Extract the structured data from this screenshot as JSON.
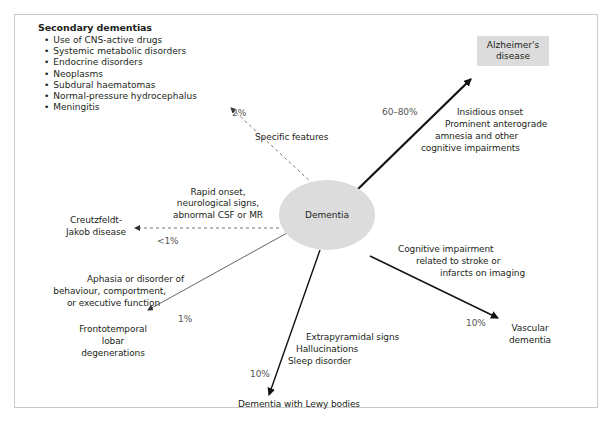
{
  "center": {
    "label": "Dementia"
  },
  "secondary": {
    "title": "Secondary dementias",
    "items": [
      "Use of CNS-active drugs",
      "Systemic metabolic disorders",
      "Endocrine disorders",
      "Neoplasms",
      "Subdural haematomas",
      "Normal-pressure hydrocephalus",
      "Meningitis"
    ],
    "percent": "2%",
    "feature": "Specific features"
  },
  "alzheimer": {
    "line1": "Alzheimer's",
    "line2": "disease",
    "percent": "60–80%",
    "features": [
      "Insidious onset",
      "Prominent anterograde",
      "amnesia and other",
      "cognitive impairments"
    ]
  },
  "cjd": {
    "line1": "Creutzfeldt-",
    "line2": "Jakob disease",
    "percent": "<1%",
    "features": [
      "Rapid onset,",
      "neurological signs,",
      "abnormal CSF or MR"
    ]
  },
  "ftld": {
    "lines": [
      "Frontotemporal",
      "lobar",
      "degenerations"
    ],
    "percent": "1%",
    "features": [
      "Aphasia or disorder of",
      "behaviour, comportment,",
      "or executive function"
    ]
  },
  "lewy": {
    "label": "Dementia with Lewy bodies",
    "percent": "10%",
    "features": [
      "Extrapyramidal signs",
      "Hallucinations",
      "Sleep disorder"
    ]
  },
  "vascular": {
    "line1": "Vascular",
    "line2": "dementia",
    "percent": "10%",
    "features": [
      "Cognitive impairment",
      "related to stroke or",
      "infarcts on imaging"
    ]
  }
}
